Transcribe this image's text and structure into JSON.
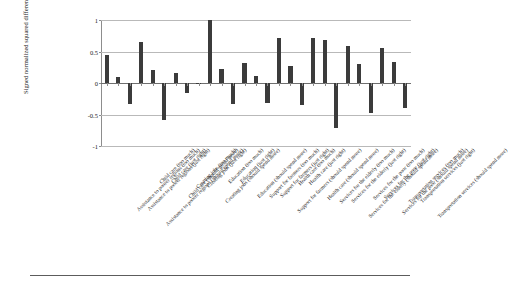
{
  "chart_data": {
    "type": "bar",
    "title": "",
    "subtitle": "",
    "xlabel": "",
    "ylabel": "Signed normalized squared difference",
    "ylim": [
      -1,
      1
    ],
    "ytick_labels": [
      "1",
      "0.5",
      "0",
      "-0.5",
      "-1"
    ],
    "ytick_values": [
      1,
      0.5,
      0,
      -0.5,
      -1
    ],
    "grid": true,
    "legend": "none",
    "bar_color": "#3b3b3b",
    "categories": [
      "Assistance to poorer regions (too much)",
      "Assistance to poorer regions (just right)",
      "Assistance to poorer regions (should spend more)",
      "Child care (too much)",
      "Child care (just right)",
      "Child care (should spend more)",
      "Creating jobs (too much)",
      "Creating jobs (just right)",
      "Creating jobs (should spend more)",
      "Education (too much)",
      "Education (just right)",
      "Education (should spend more)",
      "Support for farmers (too much)",
      "Support for farmers (just right)",
      "Support for farmers (should spend more)",
      "Health care (too much)",
      "Health care (just right)",
      "Health care (should spend more)",
      "Services for the elderly (too much)",
      "Services for the elderly (just right)",
      "Services for the elderly (should spend more)",
      "Services for the poor (too much)",
      "Services for the poor (just right)",
      "Services for the poor (should spend more)",
      "Transportation services (too much)",
      "Transportation services (just right)",
      "Transportation services (should spend more)"
    ],
    "values": [
      0.45,
      0.1,
      -0.34,
      0.65,
      0.21,
      -0.58,
      0.16,
      -0.16,
      -0.02,
      1.0,
      0.22,
      -0.34,
      0.32,
      0.11,
      -0.31,
      0.72,
      0.27,
      -0.35,
      0.72,
      0.68,
      -0.72,
      0.58,
      0.3,
      -0.48,
      0.56,
      0.33,
      -0.39
    ]
  },
  "figure": {
    "axis_color": "#8d8d8d",
    "grid_color": "#b9b9b9",
    "text_color": "#1a1a1a"
  }
}
